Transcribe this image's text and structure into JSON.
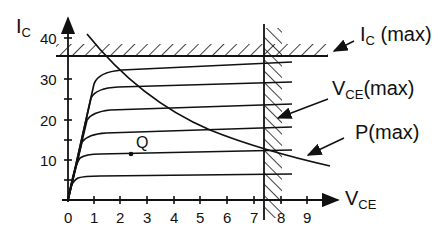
{
  "diagram": {
    "type": "transistor-output-characteristics",
    "y_axis": {
      "symbol": "I",
      "subscript": "C",
      "ticks": [
        "40",
        "30",
        "20",
        "10"
      ]
    },
    "x_axis": {
      "symbol": "V",
      "subscript": "CE",
      "ticks": [
        "0",
        "1",
        "2",
        "3",
        "4",
        "5",
        "6",
        "7",
        "8",
        "9"
      ]
    },
    "labels": {
      "ic_max": {
        "main": "I",
        "sub": "C",
        "suffix": " (max)"
      },
      "vce_max": {
        "main": "V",
        "sub": "CE",
        "suffix": "(max)"
      },
      "p_max": "P(max)",
      "q_point": "Q"
    },
    "curves": {
      "count": 6,
      "saturation_levels_mA": [
        6,
        12,
        17,
        23,
        28,
        33
      ]
    },
    "limits": {
      "ic_max": 35,
      "vce_max": 7.4
    },
    "line_color": "#111111",
    "background": "#ffffff"
  }
}
